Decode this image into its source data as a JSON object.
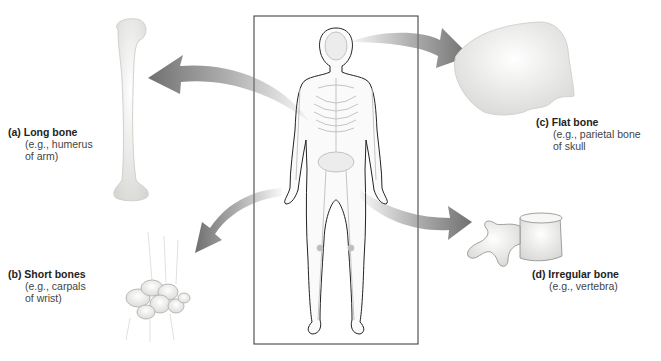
{
  "diagram": {
    "colors": {
      "arrow": "#7a7a7a",
      "frame": "#333333",
      "bone_fill": "#f2f2f0",
      "bone_shade": "#cfcfcc",
      "outline": "#222222"
    },
    "labels": [
      {
        "id": "a",
        "title": "(a) Long bone",
        "sub": "(e.g., humerus\nof arm)"
      },
      {
        "id": "b",
        "title": "(b) Short bones",
        "sub": "(e.g., carpals\nof wrist)"
      },
      {
        "id": "c",
        "title": "(c) Flat bone",
        "sub": "(e.g., parietal bone\nof skull"
      },
      {
        "id": "d",
        "title": "(d) Irregular bone",
        "sub": "(e.g., vertebra)"
      }
    ],
    "illustrations": {
      "center": "human-skeleton-figure",
      "a": "humerus-bone",
      "b": "carpal-bones",
      "c": "parietal-bone",
      "d": "vertebra"
    }
  }
}
